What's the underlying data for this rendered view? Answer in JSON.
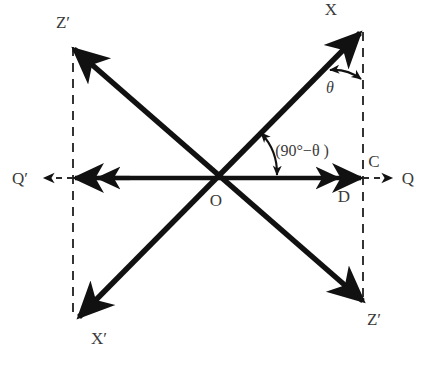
{
  "diagram": {
    "colors": {
      "axis": "#111111",
      "dashed": "#2b2b2b",
      "label": "#3a3a3a",
      "background": "#ffffff"
    },
    "origin_label": "O",
    "labels": {
      "z_prime_top_left": "Z′",
      "z_prime_bottom_right": "Z′",
      "x_top_right": "X",
      "x_prime_bottom_left": "X′",
      "q_right": "Q",
      "q_prime_left": "Q′",
      "point_c": "C",
      "point_d": "D",
      "origin": "O",
      "angle_theta": "θ",
      "angle_complement": "(90°−θ )"
    },
    "geometry": {
      "origin": {
        "x": 218,
        "y": 178
      },
      "axes": [
        {
          "name": "horizontal-QQ-prime",
          "from": {
            "x": 73,
            "y": 178
          },
          "to": {
            "x": 363,
            "y": 178
          },
          "style": "solid",
          "arrows": "both"
        },
        {
          "name": "X-OX-prime",
          "from": {
            "x": 360,
            "y": 32
          },
          "to": {
            "x": 78,
            "y": 318
          },
          "style": "solid",
          "arrows": "both"
        },
        {
          "name": "Z-prime-OZ-prime",
          "from": {
            "x": 72,
            "y": 47
          },
          "to": {
            "x": 365,
            "y": 302
          },
          "style": "solid",
          "arrows": "both"
        }
      ],
      "dashed_lines": [
        {
          "name": "left-vertical",
          "from": {
            "x": 73,
            "y": 47
          },
          "to": {
            "x": 73,
            "y": 318
          }
        },
        {
          "name": "right-vertical",
          "from": {
            "x": 363,
            "y": 32
          },
          "to": {
            "x": 363,
            "y": 303
          }
        },
        {
          "name": "left-extension",
          "from": {
            "x": 73,
            "y": 178
          },
          "to": {
            "x": 38,
            "y": 178
          }
        },
        {
          "name": "right-extension",
          "from": {
            "x": 363,
            "y": 178
          },
          "to": {
            "x": 396,
            "y": 178
          }
        }
      ],
      "angle_arcs": [
        {
          "name": "theta-arc",
          "center": {
            "x": 363,
            "y": 32
          },
          "radius": 48,
          "between": "X-ray and right vertical dashed line"
        },
        {
          "name": "complement-arc",
          "center": {
            "x": 218,
            "y": 178
          },
          "radius": 60,
          "between": "X-ray and horizontal axis"
        }
      ]
    }
  }
}
